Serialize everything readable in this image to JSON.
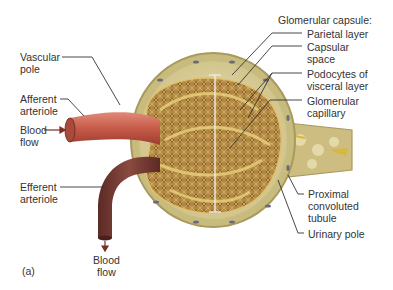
{
  "figure": {
    "panel_label": "(a)",
    "colors": {
      "afferent": "#c65a48",
      "efferent": "#7a3a33",
      "capsule": "#d9cf9a",
      "capsule_edge": "#a89a5c",
      "glomerulus": "#b38a45",
      "background": "#ffffff"
    }
  },
  "labels": {
    "vascular_pole": [
      "Vascular",
      "pole"
    ],
    "afferent_arteriole": [
      "Afferent",
      "arteriole"
    ],
    "blood_flow_in": [
      "Blood",
      "flow"
    ],
    "efferent_arteriole": [
      "Efferent",
      "arteriole"
    ],
    "blood_flow_out": [
      "Blood",
      "flow"
    ],
    "glomerular_capsule": "Glomerular capsule:",
    "parietal_layer": "Parietal layer",
    "capsular_space": [
      "Capsular",
      "space"
    ],
    "podocytes": [
      "Podocytes of",
      "visceral layer"
    ],
    "glomerular_capillary": [
      "Glomerular",
      "capillary"
    ],
    "proximal_tubule": [
      "Proximal",
      "convoluted",
      "tubule"
    ],
    "urinary_pole": "Urinary pole"
  }
}
